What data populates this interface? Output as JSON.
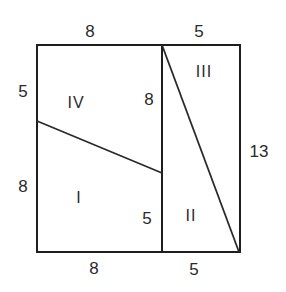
{
  "diagram": {
    "type": "geometric-dissection",
    "colors": {
      "stroke": "#1e1e1e",
      "text": "#2a2a2a",
      "background": "#ffffff"
    },
    "outer_rect": {
      "x1": 37,
      "y1": 45,
      "x2": 240,
      "y2": 252
    },
    "divider": {
      "x1": 162,
      "y1": 45,
      "x2": 162,
      "y2": 252
    },
    "diagonal": {
      "x1": 162,
      "y1": 45,
      "x2": 239,
      "y2": 252
    },
    "slant": {
      "x1": 37,
      "y1": 121,
      "x2": 162,
      "y2": 173
    },
    "regions": [
      {
        "id": "IV",
        "label": "IV"
      },
      {
        "id": "I",
        "label": "I"
      },
      {
        "id": "III",
        "label": "III"
      },
      {
        "id": "II",
        "label": "II"
      }
    ],
    "dimensions": {
      "top_left": "8",
      "top_right": "5",
      "left_upper": "5",
      "left_lower": "8",
      "inner_upper": "8",
      "inner_lower": "5",
      "right": "13",
      "bottom_left": "8",
      "bottom_right": "5"
    }
  }
}
